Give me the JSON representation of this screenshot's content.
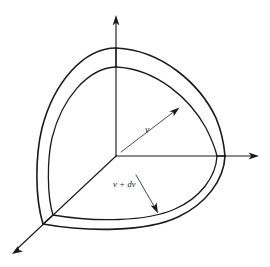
{
  "figure": {
    "background_color": "#ffffff",
    "line_color": "#1a1a1a",
    "width": 270,
    "height": 267
  },
  "axes": [
    {
      "name": "vertical-axis",
      "label": "",
      "direction": "up",
      "origin": [
        116,
        156
      ],
      "tip": [
        116,
        16
      ]
    },
    {
      "name": "horizontal-axis",
      "label": "",
      "direction": "right",
      "origin": [
        116,
        156
      ],
      "tip": [
        259,
        156
      ]
    },
    {
      "name": "depth-axis",
      "label": "",
      "direction": "down-left",
      "origin": [
        116,
        156
      ],
      "tip": [
        12,
        254
      ]
    }
  ],
  "labels": {
    "inner_radius": {
      "text": "v",
      "meaning": "speed v, inner shell radius",
      "x": 145,
      "y": 133
    },
    "outer_radius": {
      "variable": "v",
      "operator": "+",
      "differential": "dv",
      "text": "v + dv",
      "meaning": "speed v plus dv, outer shell radius",
      "x": 113,
      "y": 187
    }
  },
  "annotations": [
    {
      "name": "inner-radius-leader",
      "from": [
        121,
        152
      ],
      "to": [
        179,
        107
      ],
      "points_to": "inner-shell-arc"
    },
    {
      "name": "shell-thickness-leader",
      "from": [
        137,
        176
      ],
      "to": [
        158,
        213
      ],
      "points_to": "shell-thickness-gap"
    }
  ],
  "shell": {
    "type": "octant-spherical-shell",
    "inner_radius_px": 101,
    "outer_radius_px": 110,
    "center": [
      116,
      156
    ],
    "description": "One octant of a spherical shell between radius v and v + dv drawn in velocity space"
  }
}
